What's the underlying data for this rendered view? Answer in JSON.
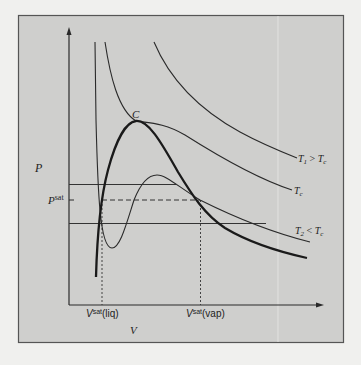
{
  "diagram": {
    "type": "pv-isotherms",
    "axes": {
      "x_label": "V",
      "y_label": "P"
    },
    "critical_point_label": "C",
    "pressure_label": "P",
    "pressure_sup": "sat",
    "isotherms": [
      {
        "label_main": "T",
        "label_sub": "1",
        "label_rel": " > ",
        "label_main2": "T",
        "label_sub2": "c"
      },
      {
        "label_main": "T",
        "label_sub": "c"
      },
      {
        "label_main": "T",
        "label_sub": "2",
        "label_rel": " < ",
        "label_main2": "T",
        "label_sub2": "c"
      }
    ],
    "volume_labels": [
      {
        "base": "V",
        "sup": "sat",
        "paren": "(liq)"
      },
      {
        "base": "V",
        "sup": "sat",
        "paren": "(vap)"
      }
    ]
  },
  "colors": {
    "panel": "#cfcfcd",
    "line": "#2a2a2a",
    "border": "#555555",
    "page": "#f0f0ee"
  }
}
